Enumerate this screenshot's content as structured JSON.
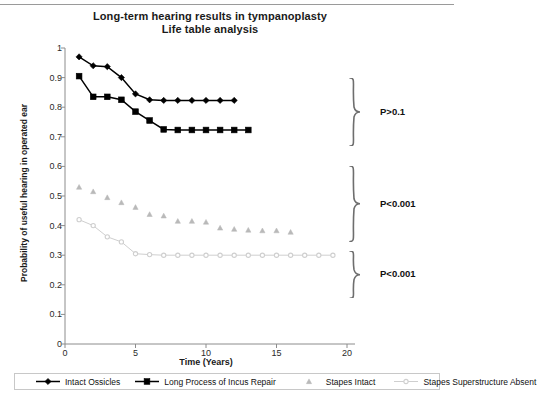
{
  "chart_data": {
    "type": "line",
    "title": "Long-term hearing results in tympanoplasty",
    "subtitle": "Life table analysis",
    "xlabel": "Time (Years)",
    "ylabel": "Probability of useful hearing in operated ear",
    "xlim": [
      0,
      20
    ],
    "ylim": [
      0,
      1
    ],
    "xticks": [
      "0",
      "5",
      "10",
      "15",
      "20"
    ],
    "yticks": [
      "0",
      "0.1",
      "0.2",
      "0.3",
      "0.4",
      "0.5",
      "0.6",
      "0.7",
      "0.8",
      "0.9",
      "1"
    ],
    "grid": false,
    "legend_position": "bottom",
    "series": [
      {
        "name": "Intact Ossicles",
        "marker": "diamond",
        "color": "#000000",
        "line": "solid",
        "x": [
          1,
          2,
          3,
          4,
          5,
          6,
          7,
          8,
          9,
          10,
          11,
          12
        ],
        "y": [
          0.97,
          0.94,
          0.937,
          0.9,
          0.845,
          0.825,
          0.823,
          0.823,
          0.823,
          0.823,
          0.823,
          0.823
        ]
      },
      {
        "name": "Long Process of Incus Repair",
        "marker": "square",
        "color": "#000000",
        "line": "solid",
        "x": [
          1,
          2,
          3,
          4,
          5,
          6,
          7,
          8,
          9,
          10,
          11,
          12,
          13
        ],
        "y": [
          0.905,
          0.835,
          0.835,
          0.825,
          0.785,
          0.755,
          0.725,
          0.723,
          0.723,
          0.723,
          0.723,
          0.723,
          0.723
        ]
      },
      {
        "name": "Stapes Intact",
        "marker": "triangle",
        "color": "#b9b9b9",
        "line": "none",
        "x": [
          1,
          2,
          3,
          4,
          5,
          6,
          7,
          8,
          9,
          10,
          11,
          12,
          13,
          14,
          15,
          16
        ],
        "y": [
          0.53,
          0.515,
          0.495,
          0.478,
          0.462,
          0.438,
          0.433,
          0.415,
          0.415,
          0.412,
          0.392,
          0.388,
          0.385,
          0.383,
          0.383,
          0.378
        ]
      },
      {
        "name": "Stapes Superstructure Absent",
        "marker": "circle",
        "color": "#cfcfcf",
        "line": "solid",
        "x": [
          1,
          2,
          3,
          4,
          5,
          6,
          7,
          8,
          9,
          10,
          11,
          12,
          13,
          14,
          15,
          16,
          17,
          18,
          19
        ],
        "y": [
          0.42,
          0.4,
          0.362,
          0.345,
          0.305,
          0.302,
          0.3,
          0.3,
          0.3,
          0.3,
          0.3,
          0.3,
          0.3,
          0.3,
          0.3,
          0.3,
          0.3,
          0.3,
          0.3
        ]
      }
    ],
    "annotations": [
      {
        "label": "P>0.1",
        "brace_top_value": 0.9,
        "brace_bottom_value": 0.67
      },
      {
        "label": "P<0.001",
        "brace_top_value": 0.6,
        "brace_bottom_value": 0.345
      },
      {
        "label": "P<0.001",
        "brace_top_value": 0.315,
        "brace_bottom_value": 0.155
      }
    ]
  },
  "legend": {
    "items": [
      {
        "label": "Intact Ossicles"
      },
      {
        "label": "Long Process of Incus Repair"
      },
      {
        "label": "Stapes Intact"
      },
      {
        "label": "Stapes Superstructure Absent"
      }
    ]
  }
}
